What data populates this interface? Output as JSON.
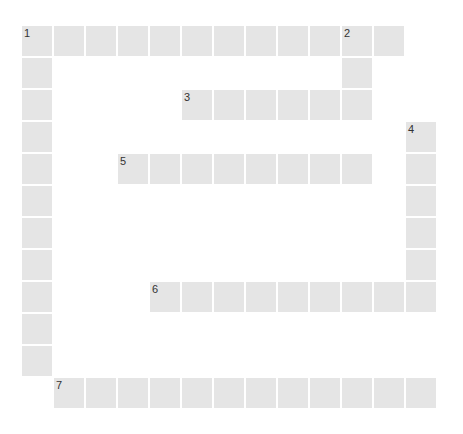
{
  "puzzle": {
    "type": "crossword",
    "grid": {
      "origin_x": 22,
      "origin_y": 26,
      "pitch": 32,
      "cell_size": 30,
      "cols": 13,
      "rows": 12
    },
    "colors": {
      "cell": "#e5e5e5",
      "background": "#ffffff",
      "number": "#333333"
    },
    "entries": [
      {
        "number": "1",
        "direction": "across",
        "row": 0,
        "col": 0,
        "length": 12
      },
      {
        "number": "1",
        "direction": "down",
        "row": 0,
        "col": 0,
        "length": 11
      },
      {
        "number": "2",
        "direction": "down",
        "row": 0,
        "col": 10,
        "length": 3
      },
      {
        "number": "3",
        "direction": "across",
        "row": 2,
        "col": 5,
        "length": 6
      },
      {
        "number": "4",
        "direction": "down",
        "row": 3,
        "col": 12,
        "length": 6
      },
      {
        "number": "5",
        "direction": "across",
        "row": 4,
        "col": 3,
        "length": 8
      },
      {
        "number": "6",
        "direction": "across",
        "row": 8,
        "col": 4,
        "length": 9
      },
      {
        "number": "7",
        "direction": "across",
        "row": 11,
        "col": 1,
        "length": 12
      }
    ]
  }
}
